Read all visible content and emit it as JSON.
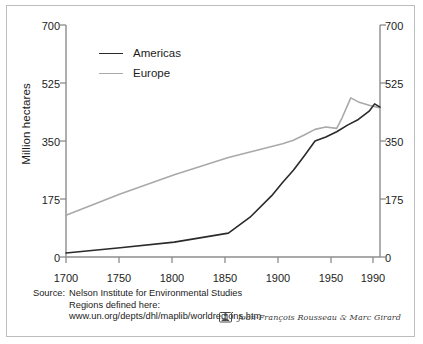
{
  "chart_data": {
    "type": "line",
    "title": "",
    "subtitle": "",
    "xlabel": "",
    "ylabel": "Million hectares",
    "xlim": [
      1700,
      1990
    ],
    "ylim": [
      0,
      700
    ],
    "grid": false,
    "legend_position": "top-left",
    "xticks": [
      1700,
      1750,
      1800,
      1850,
      1900,
      1950,
      1990
    ],
    "xticklabels": [
      "1700",
      "1750",
      "1800",
      "1850",
      "1900",
      "1950",
      "1990"
    ],
    "yticks": [
      0,
      175,
      350,
      525,
      700
    ],
    "yticklabels": [
      "0",
      "175",
      "350",
      "525",
      "700"
    ],
    "right_axis": {
      "visible": true,
      "yticks": [
        0,
        175,
        350,
        525,
        700
      ],
      "yticklabels": [
        "0",
        "175",
        "350",
        "525",
        "700"
      ]
    },
    "series": [
      {
        "name": "Americas",
        "color": "#2a2a2a",
        "x": [
          1700,
          1750,
          1800,
          1850,
          1870,
          1890,
          1900,
          1910,
          1920,
          1930,
          1940,
          1950,
          1960,
          1970,
          1980,
          1985,
          1990
        ],
        "values": [
          12,
          28,
          45,
          72,
          120,
          185,
          225,
          262,
          305,
          350,
          362,
          378,
          398,
          415,
          440,
          462,
          452
        ]
      },
      {
        "name": "Europe",
        "color": "#a9a9a9",
        "x": [
          1700,
          1750,
          1800,
          1850,
          1900,
          1910,
          1920,
          1930,
          1940,
          1950,
          1955,
          1963,
          1970,
          1980,
          1990
        ],
        "values": [
          126,
          190,
          248,
          300,
          342,
          352,
          368,
          385,
          392,
          388,
          420,
          480,
          468,
          458,
          450
        ]
      }
    ]
  },
  "legend": {
    "items": [
      {
        "label": "Americas",
        "color": "#2a2a2a"
      },
      {
        "label": "Europe",
        "color": "#a9a9a9"
      }
    ]
  },
  "axes": {
    "y_axis_title": "Million hectares",
    "left_ticks": [
      "700",
      "525",
      "350",
      "175",
      "0"
    ],
    "right_ticks": [
      "700",
      "525",
      "350",
      "175",
      "0"
    ],
    "x_ticks": [
      "1700",
      "1750",
      "1800",
      "1850",
      "1900",
      "1950",
      "1990"
    ]
  },
  "footer": {
    "source_key": "Source:",
    "source_line1": "Nelson Institute for Environmental Studies",
    "source_line2": "Regions defined here:",
    "source_line3": "www.un.org/depts/dhl/maplib/worldregions.htm",
    "credit": "Jean-François Rousseau & Marc Girard",
    "credit_mark_name": "author-emblem"
  },
  "colors": {
    "americas": "#2a2a2a",
    "europe": "#a9a9a9",
    "axis": "#8c8c8c",
    "text": "#1c1c1c",
    "frame": "#bdbdbd",
    "background": "#ffffff"
  }
}
